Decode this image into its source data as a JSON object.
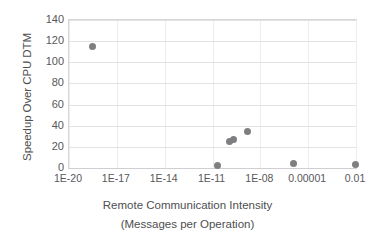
{
  "chart_data": {
    "type": "scatter",
    "title": "",
    "xlabel_line1": "Remote Communication Intensity",
    "xlabel_line2": "(Messages per Operation)",
    "ylabel": "Speedup Over CPU DTM",
    "xscale": "log",
    "xlim": [
      1e-20,
      0.01
    ],
    "ylim": [
      0,
      140
    ],
    "grid": "horizontal",
    "legend": "none",
    "marker_color": "#7f7f81",
    "xticklabels": [
      "1E-20",
      "1E-17",
      "1E-14",
      "1E-11",
      "1E-08",
      "0.00001",
      "0.01"
    ],
    "xtickvalues": [
      1e-20,
      1e-17,
      1e-14,
      1e-11,
      1e-08,
      1e-05,
      0.01
    ],
    "yticklabels": [
      "0",
      "20",
      "40",
      "60",
      "80",
      "100",
      "120",
      "140"
    ],
    "ytickvalues": [
      0,
      20,
      40,
      60,
      80,
      100,
      120,
      140
    ],
    "points": [
      {
        "x": 3e-19,
        "y": 115
      },
      {
        "x": 2e-11,
        "y": 2
      },
      {
        "x": 1.2e-10,
        "y": 25
      },
      {
        "x": 2.2e-10,
        "y": 27
      },
      {
        "x": 1.5e-09,
        "y": 35
      },
      {
        "x": 1.2e-06,
        "y": 4
      },
      {
        "x": 0.009,
        "y": 3
      }
    ]
  }
}
